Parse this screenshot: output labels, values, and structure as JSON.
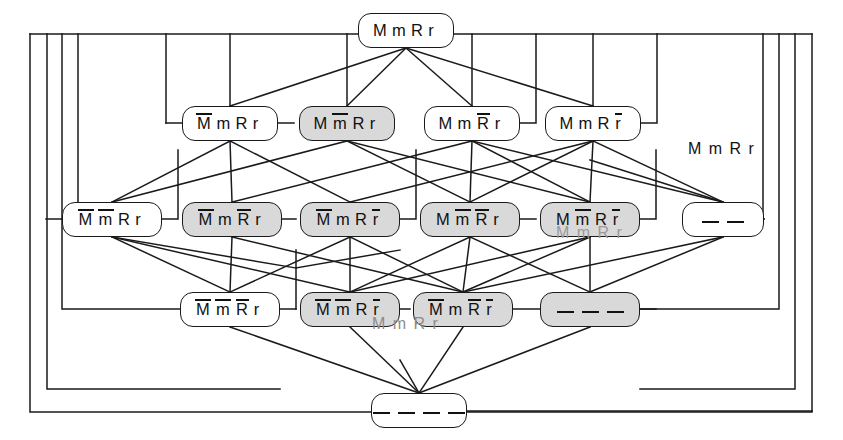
{
  "figure": {
    "type": "lattice-hasse-diagram",
    "title_text_visible": false,
    "free_labels": [
      {
        "name": "right-annotation",
        "text": "M m R r",
        "x": 688,
        "y": 140
      },
      {
        "name": "ghost-label-row3",
        "text": "M m R r",
        "x": 556,
        "y": 224
      },
      {
        "name": "ghost-label-row4",
        "text": "M m R r",
        "x": 372,
        "y": 315
      }
    ],
    "colors": {
      "line": "#1a1a1a",
      "node_fill_plain": "#ffffff",
      "node_fill_shaded": "#d9d9d9",
      "text": "#111111",
      "ghost_text": "#9a9a9a",
      "background": "#ffffff"
    }
  },
  "nodes": [
    {
      "id": "n0",
      "row": 0,
      "label": "M m R r",
      "tokens": [
        {
          "t": "M",
          "bar": false
        },
        {
          "t": "m",
          "bar": false
        },
        {
          "t": "R",
          "bar": false
        },
        {
          "t": "r",
          "bar": false
        }
      ],
      "shaded": false,
      "x": 358,
      "y": 13,
      "w": 96,
      "h": 35
    },
    {
      "id": "n1_1",
      "row": 1,
      "label": "M̅ m R r",
      "tokens": [
        {
          "t": "M",
          "bar": true
        },
        {
          "t": "m",
          "bar": false
        },
        {
          "t": "R",
          "bar": false
        },
        {
          "t": "r",
          "bar": false
        }
      ],
      "shaded": false,
      "x": 182,
      "y": 106,
      "w": 96,
      "h": 35
    },
    {
      "id": "n1_2",
      "row": 1,
      "label": "M m̅ R r",
      "tokens": [
        {
          "t": "M",
          "bar": false
        },
        {
          "t": "m",
          "bar": true
        },
        {
          "t": "R",
          "bar": false
        },
        {
          "t": "r",
          "bar": false
        }
      ],
      "shaded": true,
      "x": 299,
      "y": 106,
      "w": 96,
      "h": 35
    },
    {
      "id": "n1_3",
      "row": 1,
      "label": "M m R̅ r",
      "tokens": [
        {
          "t": "M",
          "bar": false
        },
        {
          "t": "m",
          "bar": false
        },
        {
          "t": "R",
          "bar": true
        },
        {
          "t": "r",
          "bar": false
        }
      ],
      "shaded": false,
      "x": 424,
      "y": 106,
      "w": 96,
      "h": 35
    },
    {
      "id": "n1_4",
      "row": 1,
      "label": "M m R r̅",
      "tokens": [
        {
          "t": "M",
          "bar": false
        },
        {
          "t": "m",
          "bar": false
        },
        {
          "t": "R",
          "bar": false
        },
        {
          "t": "r",
          "bar": true
        }
      ],
      "shaded": false,
      "x": 545,
      "y": 106,
      "w": 96,
      "h": 35
    },
    {
      "id": "n2_1",
      "row": 2,
      "label": "M̅ m̅ R r",
      "tokens": [
        {
          "t": "M",
          "bar": true
        },
        {
          "t": "m",
          "bar": true
        },
        {
          "t": "R",
          "bar": false
        },
        {
          "t": "r",
          "bar": false
        }
      ],
      "shaded": false,
      "x": 62,
      "y": 202,
      "w": 100,
      "h": 35
    },
    {
      "id": "n2_2",
      "row": 2,
      "label": "M̅ m R̅ r",
      "tokens": [
        {
          "t": "M",
          "bar": true
        },
        {
          "t": "m",
          "bar": false
        },
        {
          "t": "R",
          "bar": true
        },
        {
          "t": "r",
          "bar": false
        }
      ],
      "shaded": true,
      "x": 182,
      "y": 202,
      "w": 100,
      "h": 35
    },
    {
      "id": "n2_3",
      "row": 2,
      "label": "M̅ m R r̅",
      "tokens": [
        {
          "t": "M",
          "bar": true
        },
        {
          "t": "m",
          "bar": false
        },
        {
          "t": "R",
          "bar": false
        },
        {
          "t": "r",
          "bar": true
        }
      ],
      "shaded": true,
      "x": 300,
      "y": 202,
      "w": 100,
      "h": 35
    },
    {
      "id": "n2_4",
      "row": 2,
      "label": "M m̅ R̅ r",
      "tokens": [
        {
          "t": "M",
          "bar": false
        },
        {
          "t": "m",
          "bar": true
        },
        {
          "t": "R",
          "bar": true
        },
        {
          "t": "r",
          "bar": false
        }
      ],
      "shaded": true,
      "x": 420,
      "y": 202,
      "w": 100,
      "h": 35
    },
    {
      "id": "n2_5",
      "row": 2,
      "label": "M m̅ R r̅",
      "tokens": [
        {
          "t": "M",
          "bar": false
        },
        {
          "t": "m",
          "bar": true
        },
        {
          "t": "R",
          "bar": false
        },
        {
          "t": "r",
          "bar": true
        }
      ],
      "shaded": true,
      "x": 540,
      "y": 202,
      "w": 100,
      "h": 35
    },
    {
      "id": "n2_6",
      "row": 2,
      "label": "— —",
      "tokens": [],
      "dashes": 2,
      "shaded": false,
      "x": 682,
      "y": 202,
      "w": 82,
      "h": 35
    },
    {
      "id": "n3_1",
      "row": 3,
      "label": "M̅ m̅ R̅ r",
      "tokens": [
        {
          "t": "M",
          "bar": true
        },
        {
          "t": "m",
          "bar": true
        },
        {
          "t": "R",
          "bar": true
        },
        {
          "t": "r",
          "bar": false
        }
      ],
      "shaded": false,
      "x": 180,
      "y": 292,
      "w": 100,
      "h": 35
    },
    {
      "id": "n3_2",
      "row": 3,
      "label": "M̅ m̅ R r̅",
      "tokens": [
        {
          "t": "M",
          "bar": true
        },
        {
          "t": "m",
          "bar": true
        },
        {
          "t": "R",
          "bar": false
        },
        {
          "t": "r",
          "bar": true
        }
      ],
      "shaded": true,
      "x": 300,
      "y": 292,
      "w": 100,
      "h": 35
    },
    {
      "id": "n3_3",
      "row": 3,
      "label": "M̅ m R̅ r̅",
      "tokens": [
        {
          "t": "M",
          "bar": true
        },
        {
          "t": "m",
          "bar": false
        },
        {
          "t": "R",
          "bar": true
        },
        {
          "t": "r",
          "bar": true
        }
      ],
      "shaded": true,
      "x": 413,
      "y": 292,
      "w": 100,
      "h": 35
    },
    {
      "id": "n3_4",
      "row": 3,
      "label": "— — —",
      "tokens": [],
      "dashes": 3,
      "shaded": true,
      "x": 540,
      "y": 292,
      "w": 100,
      "h": 35
    },
    {
      "id": "n4_1",
      "row": 4,
      "label": "— — — —",
      "tokens": [],
      "dashes": 4,
      "shaded": false,
      "x": 371,
      "y": 393,
      "w": 96,
      "h": 35
    }
  ],
  "edges_description": "Each row-N node connects downward to row-(N+1) nodes that extend its set of barred alleles; long orthogonal routes along the left and right margins connect extreme nodes.",
  "counts": {
    "rows": 5,
    "total_nodes": 16,
    "shaded_nodes": 9,
    "plain_nodes": 7
  }
}
